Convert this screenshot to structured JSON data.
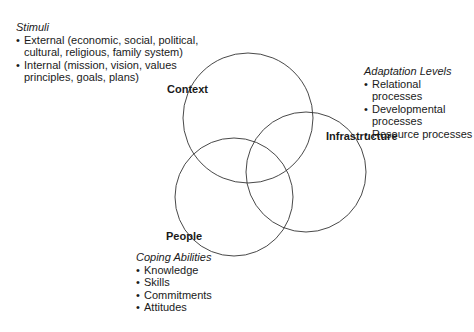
{
  "diagram": {
    "circles": [
      {
        "id": "context",
        "label": "Context",
        "cx": 248,
        "cy": 118,
        "r": 65
      },
      {
        "id": "infrastructure",
        "label": "Infrastructure",
        "cx": 306,
        "cy": 172,
        "r": 60
      },
      {
        "id": "people",
        "label": "People",
        "cx": 234,
        "cy": 197,
        "r": 59
      }
    ],
    "stroke_color": "#333333"
  },
  "stimuli": {
    "title": "Stimuli",
    "items": [
      "External (economic, social, political, cultural, religious, family system)",
      "Internal (mission, vision, values principles, goals, plans)"
    ]
  },
  "adaptation": {
    "title": "Adaptation Levels",
    "items": [
      "Relational processes",
      "Developmental processes",
      "Resource processes"
    ]
  },
  "coping": {
    "title": "Coping Abilities",
    "items": [
      "Knowledge",
      "Skills",
      "Commitments",
      "Attitudes"
    ]
  }
}
